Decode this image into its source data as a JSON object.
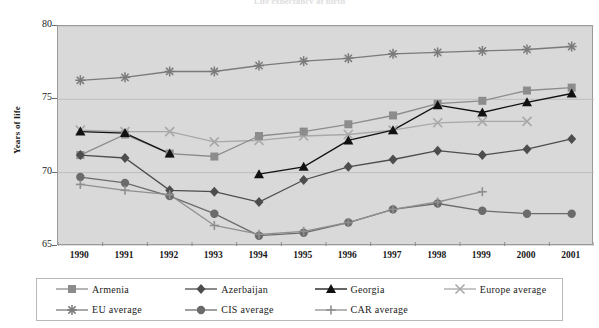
{
  "chart_title": "Life expectancy at birth",
  "y_axis_title": "Years of life",
  "y_ticks": [
    "80",
    "75",
    "70",
    "65"
  ],
  "x_ticks": [
    "1990",
    "1991",
    "1992",
    "1993",
    "1994",
    "1995",
    "1996",
    "1997",
    "1998",
    "1999",
    "2000",
    "2001"
  ],
  "legend": {
    "items": [
      {
        "label": "Armenia",
        "marker": "square-marker",
        "color": "#8c8c8c"
      },
      {
        "label": "Azerbaijan",
        "marker": "diamond-marker",
        "color": "#4d4d4d"
      },
      {
        "label": "Georgia",
        "marker": "triangle-marker",
        "color": "#111111"
      },
      {
        "label": "Europe average",
        "marker": "cross-x-marker",
        "color": "#a8a8a8"
      },
      {
        "label": "EU average",
        "marker": "star-marker",
        "color": "#7a7a7a"
      },
      {
        "label": "CIS average",
        "marker": "circle-marker",
        "color": "#6b6b6b"
      },
      {
        "label": "CAR average",
        "marker": "plus-marker",
        "color": "#8f8f8f"
      }
    ]
  },
  "chart_data": {
    "type": "line",
    "title": "Life expectancy at birth",
    "xlabel": "",
    "ylabel": "Years of life",
    "ylim": [
      65,
      80
    ],
    "y_tick_values": [
      65,
      70,
      75,
      80
    ],
    "grid": true,
    "legend_position": "bottom",
    "plot_background": "#d9d9d9",
    "categories": [
      "1990",
      "1991",
      "1992",
      "1993",
      "1994",
      "1995",
      "1996",
      "1997",
      "1998",
      "1999",
      "2000",
      "2001"
    ],
    "series": [
      {
        "name": "Armenia",
        "marker": "square",
        "color": "#8c8c8c",
        "values": [
          71.2,
          72.6,
          71.3,
          71.1,
          72.5,
          72.8,
          73.3,
          73.9,
          74.7,
          74.9,
          75.6,
          75.8
        ]
      },
      {
        "name": "Azerbaijan",
        "marker": "diamond",
        "color": "#4d4d4d",
        "values": [
          71.2,
          71.0,
          68.8,
          68.7,
          68.0,
          69.5,
          70.4,
          70.9,
          71.5,
          71.2,
          71.6,
          72.3
        ]
      },
      {
        "name": "Georgia",
        "marker": "triangle",
        "color": "#111111",
        "values": [
          72.8,
          72.7,
          71.3,
          null,
          69.9,
          70.4,
          72.2,
          72.9,
          74.6,
          74.1,
          74.8,
          75.4
        ]
      },
      {
        "name": "Europe average",
        "marker": "x",
        "color": "#a8a8a8",
        "values": [
          72.9,
          72.8,
          72.8,
          72.1,
          72.2,
          72.5,
          72.6,
          72.9,
          73.4,
          73.5,
          73.5,
          null
        ]
      },
      {
        "name": "EU average",
        "marker": "star",
        "color": "#7a7a7a",
        "values": [
          76.3,
          76.5,
          76.9,
          76.9,
          77.3,
          77.6,
          77.8,
          78.1,
          78.2,
          78.3,
          78.4,
          78.6
        ]
      },
      {
        "name": "CIS average",
        "marker": "circle",
        "color": "#6b6b6b",
        "values": [
          69.7,
          69.3,
          68.4,
          67.2,
          65.7,
          65.9,
          66.6,
          67.5,
          67.9,
          67.4,
          67.2,
          67.2
        ]
      },
      {
        "name": "CAR average",
        "marker": "plus",
        "color": "#8f8f8f",
        "values": [
          69.2,
          68.8,
          68.5,
          66.4,
          65.8,
          66.0,
          66.6,
          67.5,
          68.0,
          68.7,
          null,
          null
        ]
      }
    ]
  }
}
